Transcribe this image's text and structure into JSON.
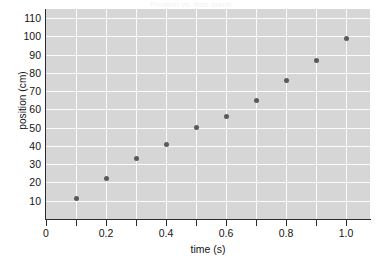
{
  "figure": {
    "top_caption": "Position vs. time graph",
    "background_color": "#ffffff",
    "plot_background_color": "#d6d6d6",
    "gridline_color": "#fbfbfb",
    "marker_color": "#5a5a5a",
    "axis_color": "#2b2b2b"
  },
  "chart_data": {
    "type": "scatter",
    "title": "",
    "xlabel": "time (s)",
    "ylabel": "position (cm)",
    "xlim": [
      0,
      1.08
    ],
    "ylim": [
      0,
      115
    ],
    "grid": true,
    "legend": null,
    "x": [
      0.1,
      0.2,
      0.3,
      0.4,
      0.5,
      0.6,
      0.7,
      0.8,
      0.9,
      1.0
    ],
    "y": [
      11,
      22,
      33,
      41,
      50,
      56,
      65,
      76,
      87,
      99
    ],
    "xticks": [
      0,
      0.2,
      0.4,
      0.6,
      0.8,
      1.0
    ],
    "xtick_labels": [
      "0",
      "0.2",
      "0.4",
      "0.6",
      "0.8",
      "1.0"
    ],
    "xminorticks": [
      0.1,
      0.3,
      0.5,
      0.7,
      0.9
    ],
    "yticks": [
      10,
      20,
      30,
      40,
      50,
      60,
      70,
      80,
      90,
      100,
      110
    ],
    "ytick_labels": [
      "10",
      "20",
      "30",
      "40",
      "50",
      "60",
      "70",
      "80",
      "90",
      "100",
      "110"
    ]
  }
}
